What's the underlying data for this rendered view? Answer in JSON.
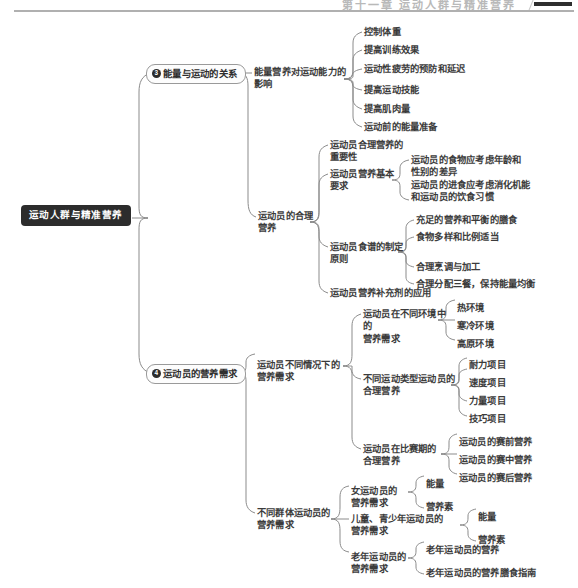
{
  "header": {
    "running_head": "第十一章   运动人群与精准营养",
    "corner_mark": "header-block"
  },
  "diagram": {
    "type": "mindmap",
    "root": {
      "label": "运动人群与精准营养"
    },
    "branches": [
      {
        "number": "3",
        "label": "能量与运动的关系",
        "children": [
          {
            "label": "能量营养对运动能力的\n影响",
            "children": [
              {
                "label": "控制体重"
              },
              {
                "label": "提高训练效果"
              },
              {
                "label": "运动性疲劳的预防和延迟"
              },
              {
                "label": "提高运动技能"
              },
              {
                "label": "提高肌肉量"
              },
              {
                "label": "运动前的能量准备"
              }
            ]
          },
          {
            "label": "运动员的合理\n营养",
            "children": [
              {
                "label": "运动员合理营养的\n重要性"
              },
              {
                "label": "运动员营养基本\n要求",
                "children": [
                  {
                    "label": "运动员的食物应考虑年龄和\n性别的差异"
                  },
                  {
                    "label": "运动员的进食应考虑消化机能\n和运动员的饮食习惯"
                  }
                ]
              },
              {
                "label": "运动员食谱的制定\n原则",
                "children": [
                  {
                    "label": "充足的营养和平衡的膳食"
                  },
                  {
                    "label": "食物多样和比例适当"
                  },
                  {
                    "label": "合理烹调与加工"
                  },
                  {
                    "label": "合理分配三餐，保持能量均衡"
                  }
                ]
              },
              {
                "label": "运动员营养补充剂的应用"
              }
            ]
          }
        ]
      },
      {
        "number": "4",
        "label": "运动员的营养需求",
        "children": [
          {
            "label": "运动员不同情况下的\n营养需求",
            "children": [
              {
                "label": "运动员在不同环境中的\n营养需求",
                "children": [
                  {
                    "label": "热环境"
                  },
                  {
                    "label": "寒冷环境"
                  },
                  {
                    "label": "高原环境"
                  }
                ]
              },
              {
                "label": "不同运动类型运动员的\n合理营养",
                "children": [
                  {
                    "label": "耐力项目"
                  },
                  {
                    "label": "速度项目"
                  },
                  {
                    "label": "力量项目"
                  },
                  {
                    "label": "技巧项目"
                  }
                ]
              },
              {
                "label": "运动员在比赛期的\n合理营养",
                "children": [
                  {
                    "label": "运动员的赛前营养"
                  },
                  {
                    "label": "运动员的赛中营养"
                  },
                  {
                    "label": "运动员的赛后营养"
                  }
                ]
              }
            ]
          },
          {
            "label": "不同群体运动员的\n营养需求",
            "children": [
              {
                "label": "女运动员的\n营养需求",
                "children": [
                  {
                    "label": "能量"
                  },
                  {
                    "label": "营养素"
                  }
                ]
              },
              {
                "label": "儿童、青少年运动员的\n营养需求",
                "children": [
                  {
                    "label": "能量"
                  },
                  {
                    "label": "营养素"
                  }
                ]
              },
              {
                "label": "老年运动员的\n营养需求",
                "children": [
                  {
                    "label": "老年运动员的营养"
                  },
                  {
                    "label": "老年运动员的营养膳食指南"
                  }
                ]
              }
            ]
          }
        ]
      }
    ]
  },
  "colors": {
    "root_bg": "#2c2c2c",
    "root_fg": "#ffffff",
    "wire": "#8b8b8b",
    "text": "#3b3b3b",
    "page_bg": "#ffffff",
    "rule": "#b0b0b0"
  }
}
